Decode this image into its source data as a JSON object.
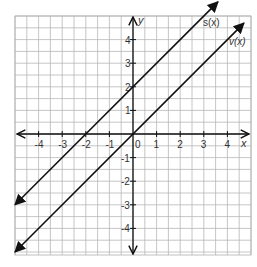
{
  "chart_data": {
    "type": "line",
    "title": "",
    "xlabel": "x",
    "ylabel": "y",
    "xlim": [
      -5,
      5
    ],
    "ylim": [
      -5,
      5
    ],
    "grid": true,
    "grid_step": 0.5,
    "x_ticks": [
      "-4",
      "-3",
      "-2",
      "-1",
      "0",
      "1",
      "2",
      "3",
      "4"
    ],
    "y_ticks": [
      "4",
      "3",
      "2",
      "1",
      "-1",
      "-2",
      "-3",
      "-4"
    ],
    "series": [
      {
        "name": "s(x)",
        "equation": "s(x) = x + 2",
        "x": [
          -5,
          3.6
        ],
        "y": [
          -3,
          5.6
        ],
        "arrows": "both"
      },
      {
        "name": "v(x)",
        "equation": "v(x) = x",
        "x": [
          -5,
          4.7
        ],
        "y": [
          -5,
          4.7
        ],
        "arrows": "both"
      }
    ],
    "legend": "inline labels near top-right line ends"
  },
  "labels": {
    "x_axis": "x",
    "y_axis": "y",
    "s_line": "s(x)",
    "v_line": "v(x)",
    "origin": "0"
  }
}
